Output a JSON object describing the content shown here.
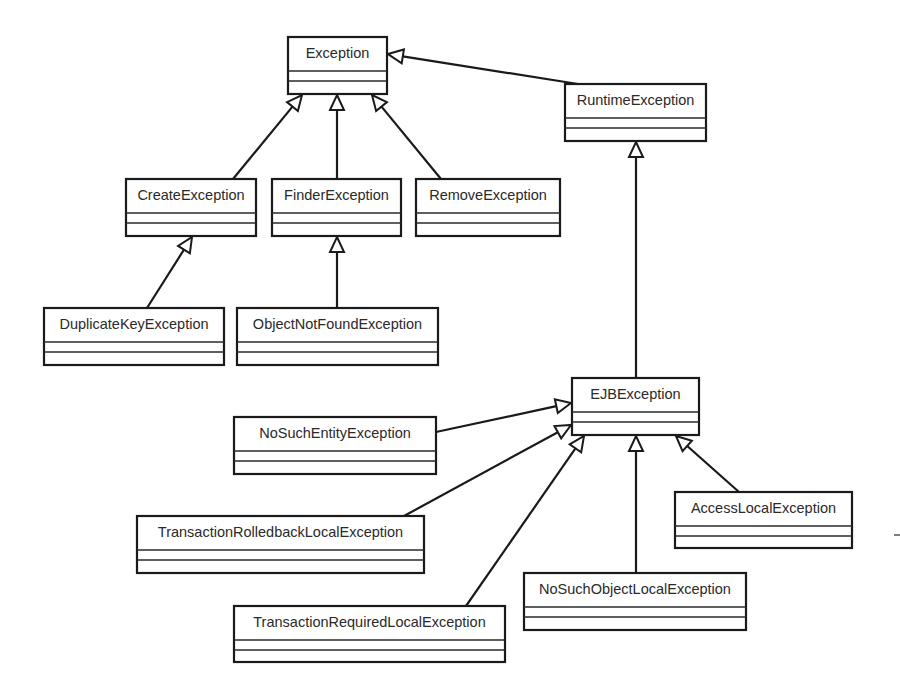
{
  "diagram": {
    "type": "uml-class-hierarchy",
    "relationship": "generalization",
    "classes": [
      {
        "id": "Exception",
        "name": "Exception"
      },
      {
        "id": "RuntimeException",
        "name": "RuntimeException"
      },
      {
        "id": "CreateException",
        "name": "CreateException"
      },
      {
        "id": "FinderException",
        "name": "FinderException"
      },
      {
        "id": "RemoveException",
        "name": "RemoveException"
      },
      {
        "id": "DuplicateKeyException",
        "name": "DuplicateKeyException"
      },
      {
        "id": "ObjectNotFoundException",
        "name": "ObjectNotFoundException"
      },
      {
        "id": "EJBException",
        "name": "EJBException"
      },
      {
        "id": "NoSuchEntityException",
        "name": "NoSuchEntityException"
      },
      {
        "id": "TransactionRolledbackLocalException",
        "name": "TransactionRolledbackLocalException"
      },
      {
        "id": "AccessLocalException",
        "name": "AccessLocalException"
      },
      {
        "id": "NoSuchObjectLocalException",
        "name": "NoSuchObjectLocalException"
      },
      {
        "id": "TransactionRequiredLocalException",
        "name": "TransactionRequiredLocalException"
      }
    ],
    "edges": [
      {
        "from": "RuntimeException",
        "to": "Exception"
      },
      {
        "from": "CreateException",
        "to": "Exception"
      },
      {
        "from": "FinderException",
        "to": "Exception"
      },
      {
        "from": "RemoveException",
        "to": "Exception"
      },
      {
        "from": "DuplicateKeyException",
        "to": "CreateException"
      },
      {
        "from": "ObjectNotFoundException",
        "to": "FinderException"
      },
      {
        "from": "EJBException",
        "to": "RuntimeException"
      },
      {
        "from": "NoSuchEntityException",
        "to": "EJBException"
      },
      {
        "from": "TransactionRolledbackLocalException",
        "to": "EJBException"
      },
      {
        "from": "TransactionRequiredLocalException",
        "to": "EJBException"
      },
      {
        "from": "NoSuchObjectLocalException",
        "to": "EJBException"
      },
      {
        "from": "AccessLocalException",
        "to": "EJBException"
      }
    ]
  }
}
